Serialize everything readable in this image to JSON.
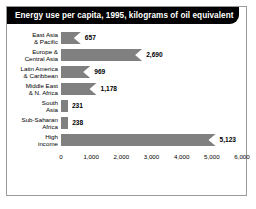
{
  "title": "Energy use per capita, 1995, kilograms of oil equivalent",
  "colors": {
    "bar": "#808080",
    "title_bar": "#000000",
    "title_text": "#ffffff",
    "frame_border": "#9a9a9a",
    "background": "#ffffff"
  },
  "chart_data": {
    "type": "bar",
    "orientation": "horizontal",
    "title": "Energy use per capita, 1995, kilograms of oil equivalent",
    "xlabel": "",
    "ylabel": "",
    "xlim": [
      0,
      6000
    ],
    "grid": false,
    "legend": false,
    "categories": [
      "East Asia\n& Pacific",
      "Europe &\nCentral Asia",
      "Latin America\n& Caribbean",
      "Middle East\n& N. Africa",
      "South\nAsia",
      "Sub-Saharan\nAfrica",
      "High\nincome"
    ],
    "values": [
      657,
      2690,
      969,
      1178,
      231,
      238,
      5123
    ],
    "value_labels": [
      "657",
      "2,690",
      "969",
      "1,178",
      "231",
      "238",
      "5,123"
    ],
    "xticks": [
      0,
      1000,
      2000,
      3000,
      4000,
      5000,
      6000
    ],
    "xtick_labels": [
      "0",
      "1,000",
      "2,000",
      "3,000",
      "4,000",
      "5,000",
      "6,000"
    ]
  }
}
